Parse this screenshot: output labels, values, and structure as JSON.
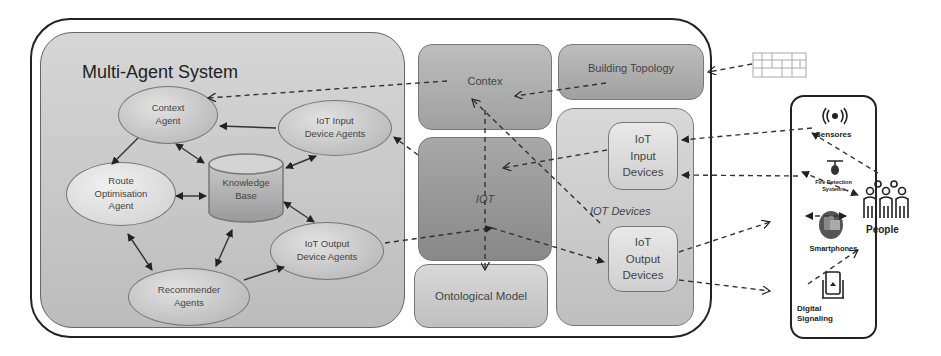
{
  "multi_agent_system": {
    "title": "Multi-Agent System",
    "agents": {
      "context": "Context\nAgent",
      "iot_input": "IoT Input\nDevice Agents",
      "route": "Route\nOptimisation\nAgent",
      "knowledge_base": "Knowledge\nBase",
      "iot_output": "IoT Output\nDevice Agents",
      "recommender": "Recommender\nAgents"
    }
  },
  "middle": {
    "contex": "Contex",
    "iot": "IOT",
    "ontological_model": "Ontological Model",
    "building_topology": "Building Topology"
  },
  "iot_devices": {
    "group_label": "IOT Devices",
    "input": "IoT\nInput\nDevices",
    "output": "IoT\nOutput\nDevices"
  },
  "devices": {
    "sensors": "Sensores",
    "fire": "Fire Detection\nSystems",
    "smartphones": "Smartphones",
    "digital": "Digital\nSignaling"
  },
  "people": {
    "label": "People"
  }
}
